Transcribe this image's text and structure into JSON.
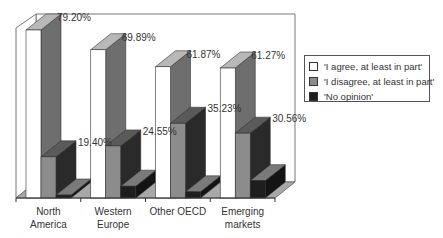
{
  "chart_data": {
    "type": "bar",
    "style": "3d-clustered",
    "title": "",
    "xlabel": "",
    "ylabel": "",
    "ylim": [
      0,
      80
    ],
    "grid": false,
    "legend_position": "right",
    "categories": [
      "North America",
      "Western Europe",
      "Other OECD",
      "Emerging markets"
    ],
    "category_lines": [
      [
        "North",
        "America"
      ],
      [
        "Western",
        "Europe"
      ],
      [
        "Other OECD"
      ],
      [
        "Emerging",
        "markets"
      ]
    ],
    "series": [
      {
        "name": "'I agree, at least in part'",
        "values": [
          79.2,
          69.89,
          61.87,
          61.27
        ],
        "labels": [
          "79.20%",
          "69.89%",
          "61.87%",
          "61.27%"
        ],
        "color": "#ffffff",
        "side": "#6e6e6e",
        "top": "#b8b8b8"
      },
      {
        "name": "'I disagree, at least in part'",
        "values": [
          19.4,
          24.55,
          35.23,
          30.56
        ],
        "labels": [
          "19.40%",
          "24.55%",
          "35.23%",
          "30.56%"
        ],
        "color": "#8c8c8c",
        "side": "#2a2a2a",
        "top": "#5a5a5a"
      },
      {
        "name": "'No opinion'",
        "values": [
          1.4,
          5.56,
          2.9,
          8.17
        ],
        "labels": [
          "",
          "",
          "",
          ""
        ],
        "color": "#1e1e1e",
        "side": "#141414",
        "top": "#7a7a7a"
      }
    ]
  },
  "legend": {
    "items": [
      {
        "label": "'I agree, at least in part'",
        "color": "#ffffff"
      },
      {
        "label": "'I disagree, at least in part'",
        "color": "#8c8c8c"
      },
      {
        "label": "'No opinion'",
        "color": "#1e1e1e"
      }
    ]
  }
}
